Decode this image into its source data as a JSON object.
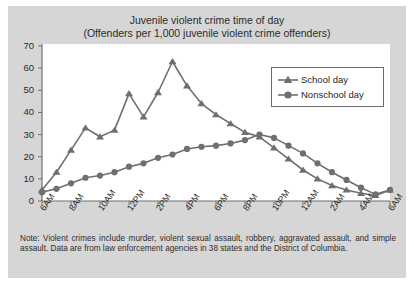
{
  "figure": {
    "background_color": "#d6d6d6",
    "plot_background_color": "#ffffff",
    "title_line1": "Juvenile violent crime time of day",
    "title_line2": "(Offenders per 1,000 juvenile violent crime offenders)",
    "note": "Note: Violent crimes include murder, violent sexual assault, robbery, aggravated assault, and simple assault. Data are from law enforcement agencies in 38 states and the District of Columbia."
  },
  "legend": {
    "position": "upper-right",
    "entries": [
      {
        "label": "School day",
        "marker": "triangle",
        "color": "#6f6f6f"
      },
      {
        "label": "Nonschool day",
        "marker": "circle",
        "color": "#6f6f6f"
      }
    ]
  },
  "chart_data": {
    "type": "line",
    "title": "Juvenile violent crime time of day (Offenders per 1,000 juvenile violent crime offenders)",
    "xlabel": "",
    "ylabel": "",
    "ylim": [
      0,
      70
    ],
    "yticks": [
      0,
      10,
      20,
      30,
      40,
      50,
      60,
      70
    ],
    "grid": false,
    "x": [
      "6AM",
      "7AM",
      "8AM",
      "9AM",
      "10AM",
      "11AM",
      "12PM",
      "1PM",
      "2PM",
      "3PM",
      "4PM",
      "5PM",
      "6PM",
      "7PM",
      "8PM",
      "9PM",
      "10PM",
      "11PM",
      "12AM",
      "1AM",
      "2AM",
      "3AM",
      "4AM",
      "5AM",
      "6AM"
    ],
    "xtick_labels": [
      "6AM",
      "8AM",
      "10AM",
      "12PM",
      "2PM",
      "4PM",
      "6PM",
      "8PM",
      "10PM",
      "12AM",
      "2AM",
      "4AM",
      "6AM"
    ],
    "xtick_indices": [
      0,
      2,
      4,
      6,
      8,
      10,
      12,
      14,
      16,
      18,
      20,
      22,
      24
    ],
    "series": [
      {
        "name": "School day",
        "marker": "triangle",
        "color": "#6f6f6f",
        "values": [
          5,
          13,
          23,
          33,
          29,
          32,
          48.5,
          38,
          49,
          63,
          52,
          44,
          39,
          35,
          31,
          29,
          24,
          19,
          14,
          10,
          7,
          5,
          3.5,
          2.5,
          5
        ]
      },
      {
        "name": "Nonschool day",
        "marker": "circle",
        "color": "#6f6f6f",
        "values": [
          4,
          5.5,
          8,
          10.5,
          11.5,
          13,
          15.5,
          17,
          19.5,
          21,
          23.5,
          24.5,
          25,
          26,
          27.5,
          30,
          28.5,
          25,
          21.5,
          17,
          13,
          9.5,
          6,
          3,
          5
        ]
      }
    ]
  }
}
